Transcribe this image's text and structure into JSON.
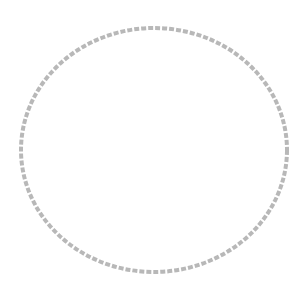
{
  "image": {
    "shape": "circle-outline",
    "icon": "empty-circle-icon",
    "stroke_color": "#b8b8b8",
    "background": "#ffffff"
  }
}
